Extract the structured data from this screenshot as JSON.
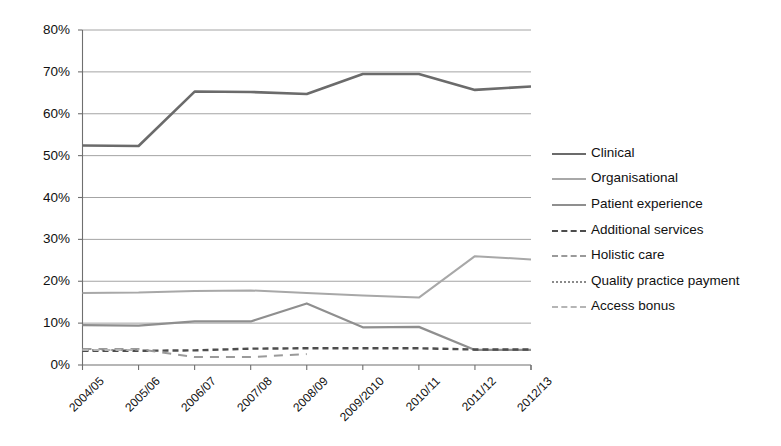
{
  "chart_data": {
    "type": "line",
    "title": "",
    "subtitle": "",
    "xlabel": "",
    "ylabel": "",
    "categories": [
      "2004/05",
      "2005/06",
      "2006/07",
      "2007/08",
      "2008/09",
      "2009/2010",
      "2010/11",
      "2011/12",
      "2012/13"
    ],
    "ylim": [
      0,
      80
    ],
    "ytick_values": [
      0,
      10,
      20,
      30,
      40,
      50,
      60,
      70,
      80
    ],
    "ytick_labels": [
      "0%",
      "10%",
      "20%",
      "30%",
      "40%",
      "50%",
      "60%",
      "70%",
      "80%"
    ],
    "grid": true,
    "grid_axis": "y",
    "legend_position": "right",
    "series": [
      {
        "name": "Clinical",
        "style": "solid",
        "color": "#6b6b6b",
        "width": 2.6,
        "values": [
          52.4,
          52.3,
          65.3,
          65.2,
          64.7,
          69.5,
          69.5,
          65.7,
          66.5
        ]
      },
      {
        "name": "Organisational",
        "style": "solid",
        "color": "#a8a8a8",
        "width": 2.0,
        "values": [
          17.2,
          17.3,
          17.7,
          17.8,
          17.2,
          16.6,
          16.1,
          26.0,
          25.2
        ]
      },
      {
        "name": "Patient experience",
        "style": "solid",
        "color": "#8f8f8f",
        "width": 2.2,
        "values": [
          9.5,
          9.4,
          10.4,
          10.4,
          14.7,
          9.0,
          9.1,
          3.6,
          3.6
        ]
      },
      {
        "name": "Additional services",
        "style": "dashed",
        "color": "#4d4d4d",
        "width": 2.4,
        "values": [
          3.4,
          3.4,
          3.5,
          3.9,
          4.0,
          4.0,
          4.0,
          3.7,
          3.7
        ]
      },
      {
        "name": "Holistic care",
        "style": "longdash",
        "color": "#9a9a9a",
        "width": 2.0,
        "values": [
          3.8,
          3.8,
          1.9,
          1.9,
          2.6,
          null,
          null,
          null,
          null
        ]
      },
      {
        "name": "Quality practice payment",
        "style": "dotted",
        "color": "#8a8a8a",
        "width": 2.0,
        "values": [
          3.6,
          3.6,
          null,
          null,
          null,
          null,
          null,
          null,
          null
        ]
      },
      {
        "name": "Access bonus",
        "style": "dashed-light",
        "color": "#b5b5b5",
        "width": 2.0,
        "values": [
          3.6,
          3.6,
          null,
          null,
          null,
          null,
          null,
          null,
          null
        ]
      }
    ]
  },
  "legend": {
    "items": [
      {
        "label": "Clinical"
      },
      {
        "label": "Organisational"
      },
      {
        "label": "Patient experience"
      },
      {
        "label": "Additional services"
      },
      {
        "label": "Holistic care"
      },
      {
        "label": "Quality practice payment"
      },
      {
        "label": "Access bonus"
      }
    ]
  },
  "axes": {
    "y_labels": [
      "80%",
      "70%",
      "60%",
      "50%",
      "40%",
      "30%",
      "20%",
      "10%",
      "0%"
    ],
    "x_labels": [
      "2004/05",
      "2005/06",
      "2006/07",
      "2007/08",
      "2008/09",
      "2009/2010",
      "2010/11",
      "2011/12",
      "2012/13"
    ]
  },
  "colors": {
    "axis": "#6f6f6f",
    "grid": "#9a9a9a",
    "text": "#111111",
    "background": "#ffffff"
  }
}
